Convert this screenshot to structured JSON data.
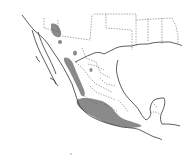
{
  "map": {
    "type": "species-range-map",
    "region": "Mexico and southern United States",
    "colors": {
      "background": "#ffffff",
      "range_fill": "#8a8a8a",
      "coastline": "#333333",
      "border": "#555555"
    },
    "legend": null,
    "labels": []
  }
}
